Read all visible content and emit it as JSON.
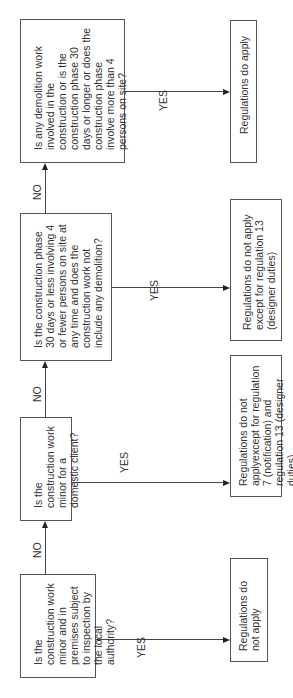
{
  "diagram": {
    "type": "flowchart",
    "orientation": "rotated-90-ccw",
    "questions": [
      {
        "id": "q1",
        "text": "Is the construction work minor and in premises subject to inspection by the local authority?"
      },
      {
        "id": "q2",
        "text": "Is the construction work minor for a domestic client?"
      },
      {
        "id": "q3",
        "text": "Is the construction phase 30 days or less involving 4 or fewer persons on site at any time and does the construction work not include any demolition?"
      },
      {
        "id": "q4",
        "text": "Is any demolition work involved in the construction or is the construction phase 30 days or longer or does the construction phase involve more than 4 persons on site?"
      }
    ],
    "outcomes": [
      {
        "id": "o1",
        "text": "Regulations do not apply"
      },
      {
        "id": "o2",
        "text": "Regulations do not applyexcept for regulation 7 (notification) and regulation 13 (designer duties)"
      },
      {
        "id": "o3",
        "text": "Regulations do not apply except for regulation 13 (designer duties)"
      },
      {
        "id": "o4",
        "text": "Regulations do apply"
      }
    ],
    "edge_labels": {
      "yes": "YES",
      "no": "NO"
    },
    "edges": [
      {
        "from": "q1",
        "to": "q2",
        "label": "NO"
      },
      {
        "from": "q2",
        "to": "q3",
        "label": "NO"
      },
      {
        "from": "q3",
        "to": "q4",
        "label": "NO"
      },
      {
        "from": "q1",
        "to": "o1",
        "label": "YES"
      },
      {
        "from": "q2",
        "to": "o2",
        "label": "YES"
      },
      {
        "from": "q3",
        "to": "o3",
        "label": "YES"
      },
      {
        "from": "q4",
        "to": "o4",
        "label": "YES"
      }
    ],
    "colors": {
      "line": "#444444",
      "border": "#555555",
      "text": "#333333"
    }
  }
}
